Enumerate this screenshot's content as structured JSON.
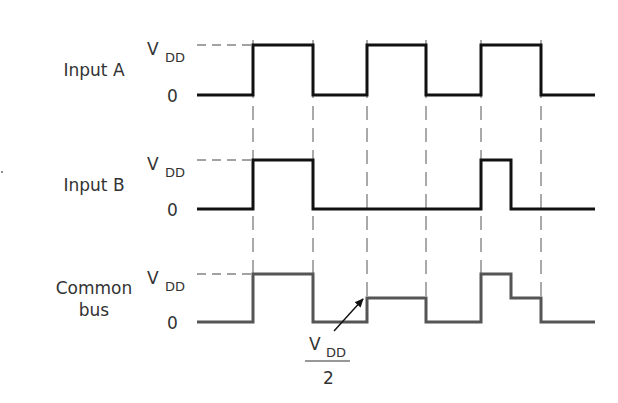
{
  "labels": {
    "vdd_main": "V",
    "vdd_sub": "DD",
    "zero": "0",
    "half_numerator_main": "V",
    "half_numerator_sub": "DD",
    "half_denominator": "2"
  },
  "signals": [
    {
      "name": "Input A",
      "label_lines": [
        "Input A"
      ],
      "color": "#111111",
      "y_high": 45,
      "y_low": 95,
      "x_start": 197,
      "x_end": 595,
      "levels": [
        {
          "from": 197,
          "to": 253,
          "level": 0
        },
        {
          "from": 253,
          "to": 313,
          "level": 1
        },
        {
          "from": 313,
          "to": 367,
          "level": 0
        },
        {
          "from": 367,
          "to": 426,
          "level": 1
        },
        {
          "from": 426,
          "to": 481,
          "level": 0
        },
        {
          "from": 481,
          "to": 541,
          "level": 1
        },
        {
          "from": 541,
          "to": 595,
          "level": 0
        }
      ]
    },
    {
      "name": "Input B",
      "label_lines": [
        "Input B"
      ],
      "color": "#111111",
      "y_high": 160,
      "y_low": 209,
      "x_start": 197,
      "x_end": 595,
      "levels": [
        {
          "from": 197,
          "to": 253,
          "level": 0
        },
        {
          "from": 253,
          "to": 313,
          "level": 1
        },
        {
          "from": 313,
          "to": 481,
          "level": 0
        },
        {
          "from": 481,
          "to": 511,
          "level": 1
        },
        {
          "from": 511,
          "to": 595,
          "level": 0
        }
      ]
    },
    {
      "name": "Common bus",
      "label_lines": [
        "Common",
        "bus"
      ],
      "color": "#555555",
      "y_high": 274,
      "y_low": 322,
      "x_start": 197,
      "x_end": 595,
      "levels": [
        {
          "from": 197,
          "to": 253,
          "level": 0
        },
        {
          "from": 253,
          "to": 313,
          "level": 1
        },
        {
          "from": 313,
          "to": 367,
          "level": 0
        },
        {
          "from": 367,
          "to": 426,
          "level": 0.5
        },
        {
          "from": 426,
          "to": 481,
          "level": 0
        },
        {
          "from": 481,
          "to": 511,
          "level": 1
        },
        {
          "from": 511,
          "to": 541,
          "level": 0.5
        },
        {
          "from": 541,
          "to": 595,
          "level": 0
        }
      ]
    }
  ],
  "transition_guides_x": [
    253,
    313,
    367,
    426,
    481,
    541
  ],
  "annotation": {
    "text": "VDD/2",
    "arrow_from": [
      334,
      331
    ],
    "arrow_to": [
      363,
      299
    ]
  }
}
